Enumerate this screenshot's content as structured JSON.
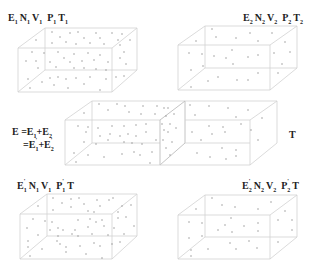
{
  "top_left": {
    "label_parts": [
      {
        "base": "E",
        "sub": "1"
      },
      {
        "base": "N",
        "sub": "1"
      },
      {
        "base": "V",
        "sub": "1"
      },
      {
        "base": " P",
        "sub": "1"
      },
      {
        "base": " T",
        "sub": "1"
      }
    ],
    "text": "E1 N1 V1 P1 T1"
  },
  "top_right": {
    "label_parts": [
      {
        "base": "E",
        "sub": "2"
      },
      {
        "base": "N",
        "sub": "2"
      },
      {
        "base": "V",
        "sub": "2"
      },
      {
        "base": " P",
        "sub": "2"
      },
      {
        "base": " T",
        "sub": "2"
      }
    ],
    "text": "E2 N2 V2 P2 T2"
  },
  "middle": {
    "equation_line1": "E = E1 + E2",
    "equation_line2": "= E'1 + E'2",
    "temperature_label": "T"
  },
  "bottom_left": {
    "text": "E'1 N1 V1 P'1 T"
  },
  "bottom_right": {
    "text": "E'2 N2 V2 P'2 T"
  },
  "colors": {
    "box_edge": "#d2d2d2",
    "particle": "#8a8a8a",
    "text": "#222222"
  }
}
